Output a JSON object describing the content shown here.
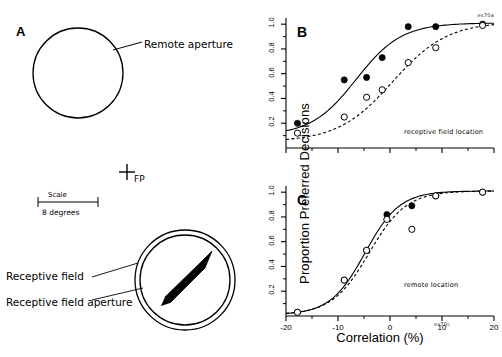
{
  "figure": {
    "panelA": {
      "letter": "A",
      "code": "es70a",
      "remote_aperture_label": "Remote aperture",
      "fixation_label": "FP",
      "scale_label": "Scale",
      "scale_value": "8 degrees",
      "receptive_field_label": "Receptive field",
      "receptive_field_aperture_label": "Receptive field aperture"
    },
    "axis": {
      "ylabel": "Proportion Preferred Decisions",
      "xlabel": "Correlation (%)",
      "yticks": [
        "0.2",
        "0.4",
        "0.6",
        "0.8",
        "1.0"
      ],
      "xticks": [
        "-20",
        "-10",
        "0",
        "10",
        "20"
      ]
    },
    "panelB": {
      "letter": "B",
      "annotation": "receptive field location"
    },
    "panelC": {
      "letter": "C",
      "annotation": "remote location",
      "code": "es70c"
    }
  },
  "chart_data": [
    {
      "type": "scatter",
      "panel": "B",
      "title": "receptive field location",
      "xlabel": "Correlation (%)",
      "ylabel": "Proportion Preferred Decisions",
      "xlim": [
        -20,
        20
      ],
      "ylim": [
        0.0,
        1.05
      ],
      "yticks": [
        0.2,
        0.4,
        0.6,
        0.8,
        1.0
      ],
      "xticks": [
        -20,
        -10,
        0,
        10,
        20
      ],
      "grid": false,
      "legend": "none",
      "series": [
        {
          "name": "filled",
          "marker": "filled-circle",
          "fit": "solid",
          "x": [
            -17.8,
            -8.8,
            -4.5,
            -1.5,
            3.5,
            8.8,
            17.8
          ],
          "y": [
            0.2,
            0.55,
            0.57,
            0.73,
            0.98,
            0.98,
            1.0
          ]
        },
        {
          "name": "open",
          "marker": "open-circle",
          "fit": "dashed",
          "x": [
            -17.8,
            -8.8,
            -4.5,
            -1.5,
            3.5,
            8.8,
            17.8
          ],
          "y": [
            0.12,
            0.25,
            0.41,
            0.47,
            0.69,
            0.81,
            0.99
          ]
        }
      ]
    },
    {
      "type": "scatter",
      "panel": "C",
      "title": "remote location",
      "xlabel": "Correlation (%)",
      "ylabel": "Proportion Preferred Decisions",
      "xlim": [
        -20,
        20
      ],
      "ylim": [
        0.0,
        1.05
      ],
      "yticks": [
        0.2,
        0.4,
        0.6,
        0.8,
        1.0
      ],
      "xticks": [
        -20,
        -10,
        0,
        10,
        20
      ],
      "grid": false,
      "legend": "none",
      "series": [
        {
          "name": "filled",
          "marker": "filled-circle",
          "fit": "solid",
          "x": [
            -17.8,
            -8.8,
            -4.5,
            -0.6,
            4.2,
            8.8,
            17.8
          ],
          "y": [
            0.03,
            0.29,
            0.53,
            0.82,
            0.89,
            0.97,
            1.0
          ]
        },
        {
          "name": "open",
          "marker": "open-circle",
          "fit": "dashed",
          "x": [
            -17.8,
            -8.8,
            -4.5,
            -0.6,
            4.2,
            8.8,
            17.8
          ],
          "y": [
            0.03,
            0.29,
            0.53,
            0.78,
            0.7,
            0.97,
            1.0
          ]
        }
      ]
    }
  ]
}
